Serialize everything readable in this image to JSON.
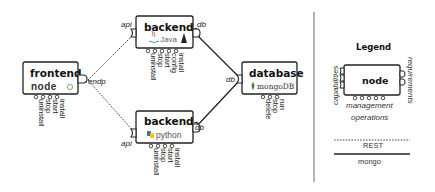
{
  "nodes": {
    "frontend": {
      "title": "frontend",
      "tech": "node",
      "tech_suffix": "®",
      "requirement": "endp",
      "operations": [
        "install",
        "start",
        "stop",
        "uninstall"
      ]
    },
    "backend1": {
      "title": "backend",
      "subscript": "1",
      "tech": "Java",
      "capability": "api",
      "requirement": "db",
      "operations": [
        "install",
        "config",
        "start",
        "stop",
        "uninstall"
      ]
    },
    "backend2": {
      "title": "backend",
      "subscript": "2",
      "tech": "python",
      "capability": "api",
      "requirement": "db",
      "operations": [
        "install",
        "start",
        "stop",
        "uninstall"
      ]
    },
    "database": {
      "title": "database",
      "tech": "mongoDB",
      "capability": "db",
      "operations": [
        "run",
        "stop",
        "delete"
      ]
    }
  },
  "legend": {
    "title": "Legend",
    "node_label": "node",
    "capabilities_label": "capabilities",
    "requirements_label": "requirements",
    "management_line1": "management",
    "management_line2": "operations",
    "rest_label": "REST",
    "mongo_label": "mongo"
  },
  "colors": {
    "stroke": "#222222",
    "node_green": "#5a9e3c",
    "python_blue": "#3b6ea5",
    "python_yellow": "#f0c419",
    "java_red": "#c0392b",
    "mongo_green": "#4b8a3a"
  }
}
